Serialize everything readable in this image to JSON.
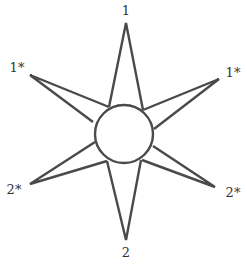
{
  "diagram": {
    "stroke_color": "#4a4a4a",
    "center": {
      "x": 124,
      "y": 134,
      "r": 29
    },
    "spikes": [
      {
        "id": "top",
        "label": "1",
        "tip": [
          126,
          23
        ],
        "base": [
          [
            109,
            107
          ],
          [
            143,
            110
          ]
        ],
        "label_pos": [
          126,
          10
        ]
      },
      {
        "id": "upper-right",
        "label": "1*",
        "tip": [
          219,
          79
        ],
        "base": [
          [
            143,
            110
          ],
          [
            154,
            129
          ]
        ],
        "label_pos": [
          233,
          72
        ]
      },
      {
        "id": "lower-right",
        "label": "2*",
        "tip": [
          215,
          187
        ],
        "base": [
          [
            153,
            146
          ],
          [
            142,
            160
          ]
        ],
        "label_pos": [
          233,
          192
        ]
      },
      {
        "id": "bottom",
        "label": "2",
        "tip": [
          126,
          240
        ],
        "base": [
          [
            107,
            161
          ],
          [
            141,
            160
          ]
        ],
        "label_pos": [
          126,
          252
        ]
      },
      {
        "id": "lower-left",
        "label": "2*",
        "tip": [
          30,
          184
        ],
        "base": [
          [
            95,
            142
          ],
          [
            107,
            161
          ]
        ],
        "label_pos": [
          14,
          189
        ]
      },
      {
        "id": "upper-left",
        "label": "1*",
        "tip": [
          30,
          75
        ],
        "base": [
          [
            93,
            122
          ],
          [
            109,
            107
          ]
        ],
        "label_pos": [
          17,
          67
        ]
      }
    ]
  }
}
